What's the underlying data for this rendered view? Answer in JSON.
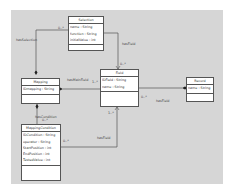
{
  "diagram": {
    "colors": {
      "background": "#d6d6d6",
      "box": "#ffffff",
      "line": "#555555"
    },
    "classes": {
      "selection": {
        "name": "Selection",
        "attributes": [
          "name : String",
          "function : String",
          "initialValue : int"
        ]
      },
      "mapping": {
        "name": "Mapping",
        "attributes": [
          "IDmapping : String"
        ]
      },
      "field": {
        "name": "Field",
        "attributes": [
          "IDField : String",
          "name : String"
        ]
      },
      "record": {
        "name": "Record",
        "attributes": [
          "name : String"
        ]
      },
      "mappingCondition": {
        "name": "MappingCondition",
        "attributes": [
          "IDCondition : String",
          "operator : String",
          "StartPosition : int",
          "EndPosition : int",
          "TestedValue : int"
        ]
      }
    },
    "associations": {
      "hasSelection": {
        "label": "hasSelection",
        "multiplicity": "0..*"
      },
      "selectionField": {
        "label": "hasField",
        "multiplicity": "0..*"
      },
      "hasMainField": {
        "label": "hasMainField",
        "multiplicity": "1..*"
      },
      "recordField": {
        "label": "hasField",
        "multiplicity": "0..*"
      },
      "hasCondition": {
        "label": "hasCondition",
        "multiplicity": "0..*"
      },
      "conditionField": {
        "label": "hasField",
        "multiplicity_source": "0..*",
        "multiplicity_target": "1..*"
      }
    }
  }
}
